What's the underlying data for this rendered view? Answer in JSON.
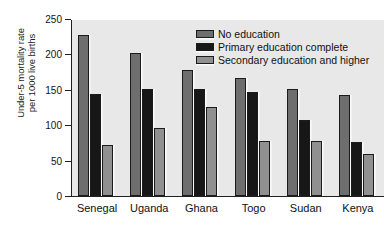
{
  "chart_data": {
    "type": "bar",
    "title": "",
    "subtitle": "",
    "xlabel": "",
    "ylabel_line1": "Under-5 mortality rate",
    "ylabel_line2": "per 1000 live births",
    "categories": [
      "Senegal",
      "Uganda",
      "Ghana",
      "Togo",
      "Sudan",
      "Kenya"
    ],
    "series": [
      {
        "name": "No education",
        "color": "#6e6e6e",
        "values": [
          227,
          202,
          178,
          167,
          151,
          143
        ]
      },
      {
        "name": "Primary education complete",
        "color": "#171717",
        "values": [
          144,
          151,
          151,
          147,
          108,
          76
        ]
      },
      {
        "name": "Secondary education and higher",
        "color": "#909090",
        "values": [
          72,
          96,
          126,
          78,
          77,
          60
        ]
      }
    ],
    "ylim": [
      0,
      250
    ],
    "yticks": [
      0,
      50,
      100,
      150,
      200,
      250
    ],
    "ytick_labels": [
      "0",
      "50",
      "100",
      "150",
      "200",
      "250"
    ],
    "grid": false,
    "legend_position": "upper right",
    "plot_background": "#e8e8e8",
    "axis_color": "#202020"
  }
}
